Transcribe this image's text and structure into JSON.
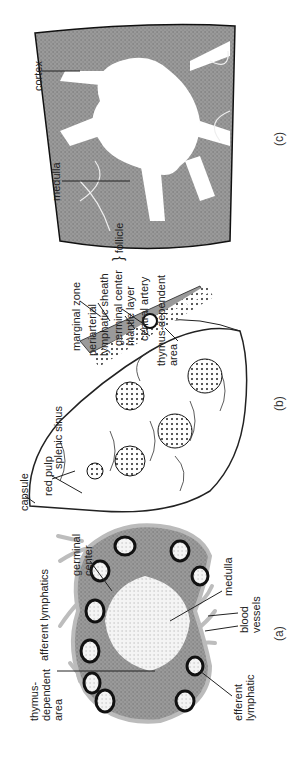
{
  "figure": {
    "panels": [
      {
        "id": "a",
        "caption": "(a)",
        "subject": "lymph node",
        "labels": {
          "thymus_dependent_area": "thymus-\ndependent\narea",
          "afferent_lymphatics": "afferent lymphatics",
          "germinal_center": "germinal\ncenter",
          "medulla": "medulla",
          "blood_vessels": "blood\nvessels",
          "efferent_lymphatic": "efferent\nlymphatic"
        }
      },
      {
        "id": "b",
        "caption": "(b)",
        "subject": "spleen",
        "labels": {
          "capsule": "capsule",
          "red_pulp": "red pulp",
          "splenic_sinus": "splenic sinus",
          "marginal_zone": "marginal zone",
          "periarterial_sheath": "periarterial\nlymphatic sheath",
          "germinal_center": "germinal center",
          "mantle_layer": "mantle layer",
          "follicle": "follicle",
          "central_artery": "central artery",
          "thymus_dependent_area": "thymus-dependent\narea"
        }
      },
      {
        "id": "c",
        "caption": "(c)",
        "subject": "thymus",
        "labels": {
          "cortex": "cortex",
          "medulla": "medulla"
        }
      }
    ],
    "colors": {
      "tissue_dark": "#8a8a8a",
      "tissue_mid": "#a8a8a8",
      "outline": "#222222",
      "light_region": "#ffffff",
      "vessel_gray": "#bdbdbd"
    }
  }
}
